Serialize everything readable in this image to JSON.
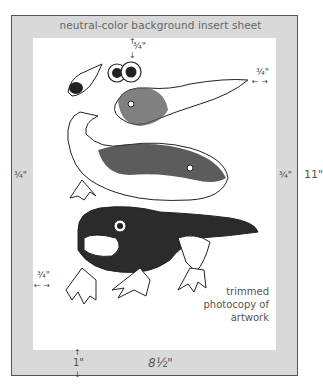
{
  "diagram": {
    "sheet_label": "neutral-color background insert sheet",
    "margins": {
      "top": "¾\"",
      "left": "¾\"",
      "right": "¾\"",
      "inner_right": "¾\"",
      "inner_left": "¾\"",
      "bottom": "1\""
    },
    "sheet_width": "8½\"",
    "sheet_height": "11\"",
    "caption": [
      "trimmed",
      "photocopy of",
      "artwork"
    ],
    "artwork": [
      "frog egg",
      "tadpole eyes",
      "tadpole",
      "tadpole with legs",
      "froglet"
    ]
  }
}
